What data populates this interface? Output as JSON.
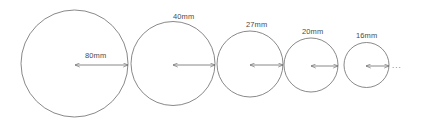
{
  "figure": {
    "background_color": "#ffffff",
    "stroke_color": "#6b6b6b",
    "text_color": "#4a4a4a",
    "continuation_marker": "...",
    "circles": [
      {
        "label": "80mm",
        "diameter_mm": 80,
        "cx": 74.5,
        "cy": 63.5,
        "r": 53.5,
        "label_x": 85,
        "label_y": 52
      },
      {
        "label": "40mm",
        "diameter_mm": 40,
        "cx": 173,
        "cy": 63.5,
        "r": 42,
        "label_x": 173,
        "label_y": 13
      },
      {
        "label": "27mm",
        "diameter_mm": 27,
        "cx": 250,
        "cy": 64,
        "r": 33,
        "label_x": 246,
        "label_y": 21
      },
      {
        "label": "20mm",
        "diameter_mm": 20,
        "cx": 311,
        "cy": 65,
        "r": 27,
        "label_x": 302,
        "label_y": 28
      },
      {
        "label": "16mm",
        "diameter_mm": 16,
        "cx": 366.5,
        "cy": 65,
        "r": 22.5,
        "label_x": 356,
        "label_y": 32
      }
    ],
    "arrows": [
      {
        "name": "radius-arrow-80mm",
        "x1": 75,
        "x2": 128,
        "y": 65
      },
      {
        "name": "radius-arrow-40mm",
        "x1": 173,
        "x2": 215,
        "y": 65
      },
      {
        "name": "radius-arrow-27mm",
        "x1": 250,
        "x2": 283,
        "y": 65
      },
      {
        "name": "radius-arrow-20mm",
        "x1": 311,
        "x2": 338,
        "y": 66
      },
      {
        "name": "radius-arrow-16mm",
        "x1": 366,
        "x2": 389,
        "y": 66
      }
    ],
    "ellipsis_x": 392,
    "ellipsis_y": 62
  }
}
